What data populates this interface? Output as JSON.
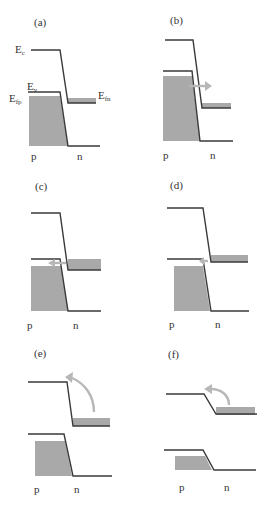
{
  "figure": {
    "colors": {
      "lines": "#3a3a3a",
      "filled_states": "#a9a9a9",
      "tunneling_arrow": "#b7b7b7",
      "background": "#ffffff"
    },
    "panels": [
      {
        "id": "a",
        "label": "(a)",
        "p_label": "p",
        "n_label": "n",
        "level_labels": {
          "Ec": "E",
          "Ec_sub": "c",
          "Ev": "E",
          "Ev_sub": "v",
          "Efp": "E",
          "Efp_sub": "fp",
          "Efn": "E",
          "Efn_sub": "fn"
        },
        "arrow": "none"
      },
      {
        "id": "b",
        "label": "(b)",
        "p_label": "p",
        "n_label": "n",
        "arrow": "right (p to n tunneling)"
      },
      {
        "id": "c",
        "label": "(c)",
        "p_label": "p",
        "n_label": "n",
        "arrow": "left (n to p tunneling, small)"
      },
      {
        "id": "d",
        "label": "(d)",
        "p_label": "p",
        "n_label": "n",
        "arrow": "left (minimal overlap)"
      },
      {
        "id": "e",
        "label": "(e)",
        "p_label": "p",
        "n_label": "n",
        "arrow": "curved up-left (thermal injection)"
      },
      {
        "id": "f",
        "label": "(f)",
        "p_label": "p",
        "n_label": "n",
        "arrow": "curved up-left (diffusion current)"
      }
    ]
  }
}
